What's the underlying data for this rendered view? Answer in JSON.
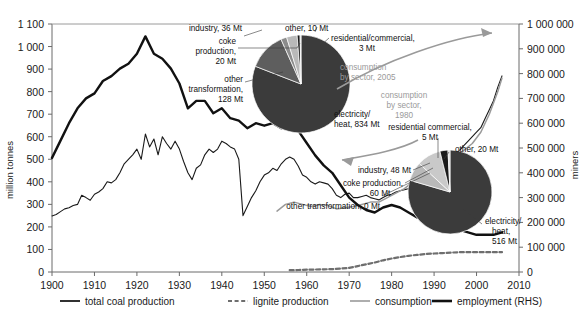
{
  "axes": {
    "left_title": "million tonnes",
    "right_title": "miners",
    "left_ticks": [
      "0",
      "100",
      "200",
      "300",
      "400",
      "500",
      "600",
      "700",
      "800",
      "900",
      "1 000",
      "1 100"
    ],
    "right_ticks": [
      "0",
      "100 000",
      "200 000",
      "300 000",
      "400 000",
      "500 000",
      "600 000",
      "700 000",
      "800 000",
      "900 000",
      "1 000 000"
    ],
    "x_ticks": [
      "1900",
      "1910",
      "1920",
      "1930",
      "1940",
      "1950",
      "1960",
      "1970",
      "1980",
      "1990",
      "2000",
      "2010"
    ]
  },
  "legend": {
    "items": [
      {
        "label": "total coal production",
        "style": "solid-thin-black",
        "color": "#1a1a1a"
      },
      {
        "label": "lignite production",
        "style": "dashed-grey",
        "color": "#6e6e6e"
      },
      {
        "label": "consumption",
        "style": "solid-grey",
        "color": "#9a9a9a"
      },
      {
        "label": "employment (RHS)",
        "style": "solid-thick-black",
        "color": "#111111"
      }
    ]
  },
  "pies": [
    {
      "caption": "consumption\nby sector, 2005",
      "caption_line1": "consumption",
      "caption_line2": "by sector, 2005",
      "labels": {
        "industry": "industry, 36 Mt",
        "other": "other, 10 Mt",
        "coke": "coke\nproduction,\n20 Mt",
        "coke_l1": "coke",
        "coke_l2": "production,",
        "coke_l3": "20 Mt",
        "other_transformation": "other\ntransformation,\n128 Mt",
        "ot_l1": "other",
        "ot_l2": "transformation,",
        "ot_l3": "128 Mt",
        "residential": "residential/commercial,\n3 Mt",
        "res_l1": "residential/commercial,",
        "res_l2": "3 Mt",
        "electricity": "electricity/\nheat, 834 Mt",
        "el_l1": "electricity/",
        "el_l2": "heat, 834 Mt"
      },
      "slices": [
        {
          "name": "electricity/heat",
          "value": 834,
          "color": "#3b3b3b"
        },
        {
          "name": "other transformation",
          "value": 128,
          "color": "#5e5e5e"
        },
        {
          "name": "coke production",
          "value": 20,
          "color": "#8c8c8c"
        },
        {
          "name": "industry",
          "value": 36,
          "color": "#b9b9b9"
        },
        {
          "name": "other",
          "value": 10,
          "color": "#1a1a1a"
        },
        {
          "name": "residential/commercial",
          "value": 3,
          "color": "#d4d4d4"
        }
      ]
    },
    {
      "caption_line1": "consumption",
      "caption_line2": "by sector,",
      "caption_line3": "1980",
      "labels": {
        "residential": "residential commercial,\n5 Mt",
        "res_l1": "residential commercial,",
        "res_l2": "5 Mt",
        "other": "other, 20 Mt",
        "industry": "industry, 48 Mt",
        "coke": "coke production,\n60 Mt",
        "coke_l1": "coke production,",
        "coke_l2": "60 Mt",
        "other_transformation": "other transformation, 0 Mt",
        "electricity": "electricity/\nheat,\n516 Mt",
        "el_l1": "electricity/",
        "el_l2": "heat,",
        "el_l3": "516 Mt"
      },
      "slices": [
        {
          "name": "electricity/heat",
          "value": 516,
          "color": "#3b3b3b"
        },
        {
          "name": "industry",
          "value": 48,
          "color": "#b9b9b9"
        },
        {
          "name": "coke production",
          "value": 60,
          "color": "#c9c9c9"
        },
        {
          "name": "other",
          "value": 20,
          "color": "#1a1a1a"
        },
        {
          "name": "residential commercial",
          "value": 5,
          "color": "#d4d4d4"
        },
        {
          "name": "other transformation",
          "value": 0,
          "color": "#888888"
        }
      ]
    }
  ],
  "chart_data": {
    "type": "line",
    "title": "",
    "xlabel": "",
    "ylabel": "million tonnes",
    "y2label": "miners",
    "xlim": [
      1900,
      2010
    ],
    "ylim": [
      0,
      1100
    ],
    "y2lim": [
      0,
      1000000
    ],
    "grid": false,
    "legend_position": "bottom",
    "series": [
      {
        "name": "total coal production",
        "axis": "left",
        "color": "#1a1a1a",
        "style": "solid-thin",
        "x": [
          1900,
          1901,
          1902,
          1903,
          1904,
          1905,
          1906,
          1907,
          1908,
          1909,
          1910,
          1911,
          1912,
          1913,
          1914,
          1915,
          1916,
          1917,
          1918,
          1919,
          1920,
          1921,
          1922,
          1923,
          1924,
          1925,
          1926,
          1927,
          1928,
          1929,
          1930,
          1931,
          1932,
          1933,
          1934,
          1935,
          1936,
          1937,
          1938,
          1939,
          1940,
          1941,
          1942,
          1943,
          1944,
          1945,
          1946,
          1947,
          1948,
          1949,
          1950,
          1951,
          1952,
          1953,
          1954,
          1955,
          1956,
          1957,
          1958,
          1959,
          1960,
          1961,
          1962,
          1963,
          1964,
          1965,
          1966,
          1967,
          1968,
          1969,
          1970,
          1971,
          1972,
          1973,
          1974,
          1975,
          1976,
          1977,
          1978,
          1979,
          1980,
          1981,
          1982,
          1983,
          1984,
          1985,
          1986,
          1987,
          1988,
          1989,
          1990,
          1991,
          1992,
          1993,
          1994,
          1995,
          1996,
          1997,
          1998,
          1999,
          2000,
          2001,
          2002,
          2003,
          2004,
          2005,
          2006
        ],
        "y": [
          249,
          255,
          268,
          280,
          285,
          295,
          300,
          340,
          330,
          318,
          345,
          355,
          370,
          400,
          395,
          410,
          440,
          480,
          500,
          520,
          545,
          500,
          612,
          555,
          590,
          520,
          600,
          570,
          545,
          580,
          545,
          490,
          440,
          410,
          460,
          475,
          520,
          545,
          530,
          545,
          580,
          570,
          555,
          545,
          500,
          250,
          290,
          330,
          360,
          400,
          430,
          440,
          460,
          450,
          480,
          500,
          510,
          500,
          470,
          430,
          420,
          400,
          390,
          400,
          395,
          390,
          370,
          340,
          330,
          345,
          350,
          330,
          330,
          335,
          340,
          330,
          325,
          320,
          330,
          340,
          345,
          355,
          360,
          365,
          370,
          380,
          390,
          400,
          410,
          430,
          440,
          450,
          470,
          490,
          510,
          520,
          540,
          560,
          580,
          600,
          620,
          640,
          680,
          720,
          760,
          820,
          870
        ]
      },
      {
        "name": "lignite production",
        "axis": "left",
        "color": "#6e6e6e",
        "style": "dashed",
        "x": [
          1956,
          1958,
          1960,
          1962,
          1964,
          1966,
          1968,
          1970,
          1972,
          1974,
          1976,
          1978,
          1980,
          1982,
          1984,
          1986,
          1988,
          1990,
          1992,
          1994,
          1996,
          1998,
          2000,
          2002,
          2004,
          2006
        ],
        "y": [
          8,
          9,
          10,
          11,
          12,
          13,
          15,
          18,
          26,
          34,
          42,
          52,
          60,
          66,
          72,
          76,
          80,
          82,
          84,
          86,
          88,
          88,
          88,
          88,
          88,
          88
        ]
      },
      {
        "name": "consumption",
        "axis": "left",
        "color": "#9a9a9a",
        "style": "solid",
        "x": [
          1953,
          1955,
          1957,
          1959,
          1961,
          1963,
          1965,
          1967,
          1969,
          1971,
          1973,
          1975,
          1977,
          1979,
          1981,
          1983,
          1985,
          1987,
          1989,
          1991,
          1993,
          1995,
          1997,
          1999,
          2001,
          2003,
          2005,
          2006
        ],
        "y": [
          270,
          300,
          310,
          300,
          290,
          300,
          295,
          280,
          285,
          290,
          300,
          310,
          310,
          330,
          350,
          370,
          400,
          420,
          440,
          460,
          490,
          510,
          540,
          570,
          620,
          700,
          800,
          860
        ]
      },
      {
        "name": "employment (RHS)",
        "axis": "right",
        "color": "#111111",
        "style": "solid-thick",
        "x": [
          1900,
          1902,
          1904,
          1906,
          1908,
          1910,
          1912,
          1914,
          1916,
          1918,
          1920,
          1922,
          1924,
          1926,
          1928,
          1930,
          1932,
          1934,
          1936,
          1938,
          1940,
          1942,
          1944,
          1946,
          1948,
          1950,
          1952,
          1954,
          1956,
          1958,
          1960,
          1962,
          1964,
          1966,
          1968,
          1970,
          1972,
          1974,
          1976,
          1978,
          1980,
          1982,
          1984,
          1986,
          1988,
          1990,
          1992,
          1994,
          1996,
          1998,
          2000,
          2002,
          2004,
          2006
        ],
        "y": [
          460000,
          530000,
          600000,
          660000,
          700000,
          720000,
          770000,
          790000,
          820000,
          840000,
          880000,
          950000,
          880000,
          860000,
          820000,
          760000,
          660000,
          690000,
          690000,
          640000,
          660000,
          620000,
          610000,
          580000,
          600000,
          590000,
          600000,
          580000,
          600000,
          570000,
          520000,
          470000,
          430000,
          400000,
          350000,
          300000,
          270000,
          250000,
          240000,
          260000,
          270000,
          260000,
          240000,
          220000,
          210000,
          200000,
          190000,
          180000,
          170000,
          160000,
          150000,
          150000,
          150000,
          160000
        ]
      }
    ]
  }
}
